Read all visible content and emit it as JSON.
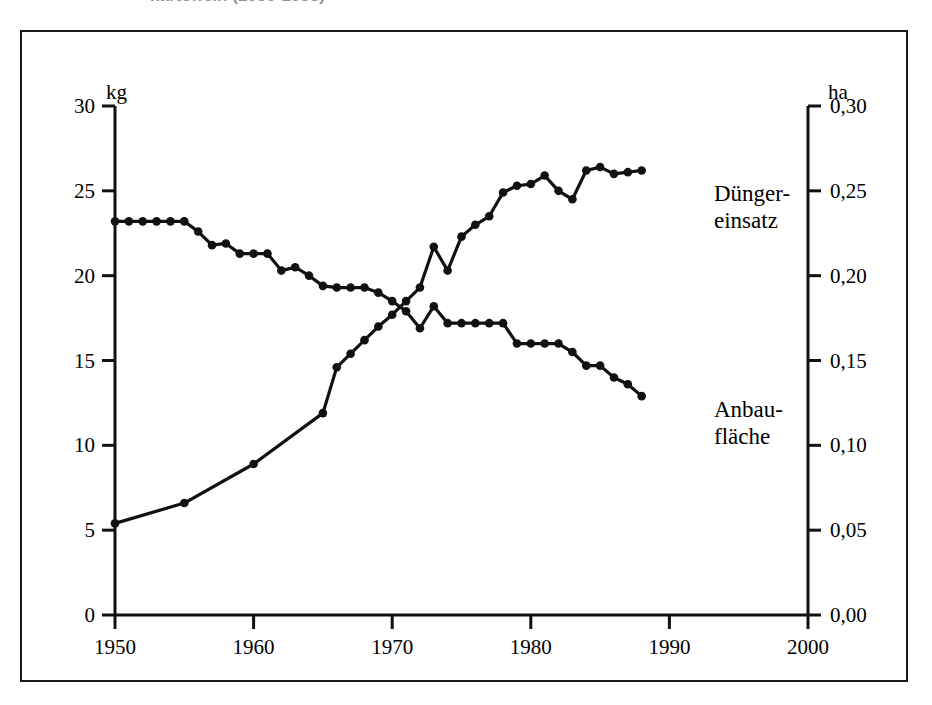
{
  "caption_remnant": "kartoffeln (1950-1988)",
  "axes": {
    "left_unit": "kg",
    "right_unit": "ha",
    "left_ticks": [
      "30",
      "25",
      "20",
      "15",
      "10",
      "5",
      "0"
    ],
    "left_tick_values": [
      30,
      25,
      20,
      15,
      10,
      5,
      0
    ],
    "right_ticks": [
      "0,30",
      "0,25",
      "0,20",
      "0,15",
      "0,10",
      "0,05",
      "0,00"
    ],
    "right_tick_values": [
      0.3,
      0.25,
      0.2,
      0.15,
      0.1,
      0.05,
      0.0
    ],
    "x_ticks": [
      "1950",
      "1960",
      "1970",
      "1980",
      "1990",
      "2000"
    ],
    "x_tick_values": [
      1950,
      1960,
      1970,
      1980,
      1990,
      2000
    ]
  },
  "series_labels": {
    "duengereinsatz": "Dünger-\neinsatz",
    "anbauflaeche": "Anbau-\nfläche"
  },
  "colors": {
    "line": "#111111",
    "frame": "#1a1a1a",
    "background": "#ffffff"
  },
  "chart_data": {
    "type": "line",
    "title": "",
    "xlabel": "",
    "ylabel": "kg",
    "ylabel_right": "ha",
    "xlim": [
      1950,
      2000
    ],
    "ylim": [
      0,
      30
    ],
    "ylim_right": [
      0.0,
      0.3
    ],
    "grid": false,
    "legend": "inline-right-of-series",
    "markers": "filled-circle",
    "series": [
      {
        "name": "Düngereinsatz",
        "axis": "left",
        "unit": "kg",
        "x": [
          1950,
          1955,
          1960,
          1965,
          1966,
          1967,
          1968,
          1969,
          1970,
          1971,
          1972,
          1973,
          1974,
          1975,
          1976,
          1977,
          1978,
          1979,
          1980,
          1981,
          1982,
          1983,
          1984,
          1985,
          1986,
          1987,
          1988
        ],
        "values": [
          5.4,
          6.6,
          8.9,
          11.9,
          14.6,
          15.4,
          16.2,
          17.0,
          17.7,
          18.5,
          19.3,
          21.7,
          20.3,
          22.3,
          23.0,
          23.5,
          24.9,
          25.3,
          25.4,
          25.9,
          25.0,
          24.5,
          26.2,
          26.4,
          26.0,
          26.1,
          26.2
        ]
      },
      {
        "name": "Anbaufläche",
        "axis": "right",
        "unit": "ha",
        "x": [
          1950,
          1951,
          1952,
          1953,
          1954,
          1955,
          1956,
          1957,
          1958,
          1959,
          1960,
          1961,
          1962,
          1963,
          1964,
          1965,
          1966,
          1967,
          1968,
          1969,
          1970,
          1971,
          1972,
          1973,
          1974,
          1975,
          1976,
          1977,
          1978,
          1979,
          1980,
          1981,
          1982,
          1983,
          1984,
          1985,
          1986,
          1987,
          1988
        ],
        "values": [
          0.232,
          0.232,
          0.232,
          0.232,
          0.232,
          0.232,
          0.226,
          0.218,
          0.219,
          0.213,
          0.213,
          0.213,
          0.203,
          0.205,
          0.2,
          0.194,
          0.193,
          0.193,
          0.193,
          0.19,
          0.185,
          0.179,
          0.169,
          0.182,
          0.172,
          0.172,
          0.172,
          0.172,
          0.172,
          0.16,
          0.16,
          0.16,
          0.16,
          0.155,
          0.147,
          0.147,
          0.14,
          0.136,
          0.129
        ]
      }
    ]
  }
}
